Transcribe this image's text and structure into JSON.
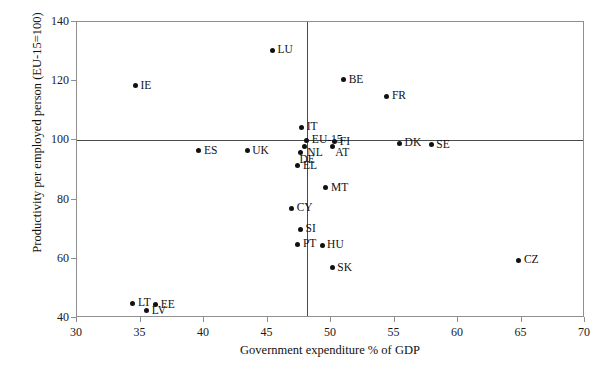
{
  "chart_data": {
    "type": "scatter",
    "title": "",
    "xlabel": "Government expenditure % of GDP",
    "ylabel": "Productivity per employed person (EU-15=100)",
    "xlim": [
      30,
      70
    ],
    "ylim": [
      40,
      140
    ],
    "xticks": [
      30,
      35,
      40,
      45,
      50,
      55,
      60,
      65,
      70
    ],
    "yticks": [
      40,
      60,
      80,
      100,
      120,
      140
    ],
    "grid": false,
    "legend": "none",
    "reference_lines": {
      "horizontal_y": 100,
      "vertical_x": 48.1
    },
    "points": [
      {
        "label": "LU",
        "x": 45.4,
        "y": 130.5,
        "label_pos": "right"
      },
      {
        "label": "IE",
        "x": 34.6,
        "y": 118.5,
        "label_pos": "right"
      },
      {
        "label": "BE",
        "x": 51.0,
        "y": 120.5,
        "label_pos": "right"
      },
      {
        "label": "FR",
        "x": 54.4,
        "y": 115.0,
        "label_pos": "right"
      },
      {
        "label": "IT",
        "x": 47.7,
        "y": 104.5,
        "label_pos": "right"
      },
      {
        "label": "EU-15",
        "x": 48.1,
        "y": 100.0,
        "label_pos": "right"
      },
      {
        "label": "FI",
        "x": 50.3,
        "y": 99.5,
        "label_pos": "right"
      },
      {
        "label": "AT",
        "x": 50.1,
        "y": 98.0,
        "label_pos": "below"
      },
      {
        "label": "NL",
        "x": 47.9,
        "y": 98.0,
        "label_pos": "below"
      },
      {
        "label": "DE",
        "x": 47.6,
        "y": 96.0,
        "label_pos": "belowleft"
      },
      {
        "label": "DK",
        "x": 55.4,
        "y": 99.0,
        "label_pos": "right"
      },
      {
        "label": "SE",
        "x": 57.9,
        "y": 98.5,
        "label_pos": "right"
      },
      {
        "label": "ES",
        "x": 39.6,
        "y": 96.5,
        "label_pos": "right"
      },
      {
        "label": "UK",
        "x": 43.4,
        "y": 96.5,
        "label_pos": "right"
      },
      {
        "label": "EL",
        "x": 47.4,
        "y": 91.5,
        "label_pos": "right"
      },
      {
        "label": "MT",
        "x": 49.6,
        "y": 84.0,
        "label_pos": "right"
      },
      {
        "label": "CY",
        "x": 46.9,
        "y": 77.0,
        "label_pos": "right"
      },
      {
        "label": "SI",
        "x": 47.6,
        "y": 70.0,
        "label_pos": "right"
      },
      {
        "label": "PT",
        "x": 47.4,
        "y": 65.0,
        "label_pos": "right"
      },
      {
        "label": "HU",
        "x": 49.3,
        "y": 64.5,
        "label_pos": "right"
      },
      {
        "label": "SK",
        "x": 50.1,
        "y": 57.0,
        "label_pos": "right"
      },
      {
        "label": "CZ",
        "x": 64.8,
        "y": 59.5,
        "label_pos": "right"
      },
      {
        "label": "LT",
        "x": 34.4,
        "y": 45.0,
        "label_pos": "right"
      },
      {
        "label": "EE",
        "x": 36.2,
        "y": 44.5,
        "label_pos": "right"
      },
      {
        "label": "LV",
        "x": 35.5,
        "y": 42.5,
        "label_pos": "right"
      }
    ]
  }
}
